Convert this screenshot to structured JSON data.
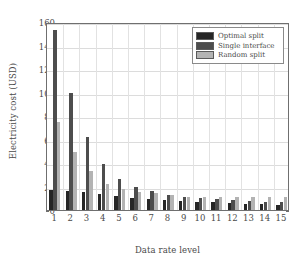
{
  "chart_data": {
    "type": "bar",
    "title": "",
    "xlabel": "Data rate level",
    "ylabel": "Electricity cost (USD)",
    "categories": [
      "1",
      "2",
      "3",
      "4",
      "5",
      "6",
      "7",
      "8",
      "9",
      "10",
      "11",
      "12",
      "13",
      "14",
      "15"
    ],
    "ylim": [
      0,
      160
    ],
    "yticks": [
      0,
      20,
      40,
      60,
      80,
      100,
      120,
      140,
      160
    ],
    "grid": true,
    "legend_position": "top-right",
    "series": [
      {
        "name": "Optimal split",
        "color": "#262626",
        "values": [
          17,
          16.5,
          15,
          13.5,
          12,
          10.5,
          9.5,
          8.5,
          7.5,
          7,
          6.5,
          6,
          5.5,
          5,
          4.5
        ]
      },
      {
        "name": "Single interface",
        "color": "#4d4d4d",
        "values": [
          153,
          99.5,
          62,
          39.5,
          26.5,
          20,
          16,
          13,
          11,
          10,
          9,
          8.5,
          7.5,
          7,
          6.5
        ]
      },
      {
        "name": "Random split",
        "color": "#b3b3b3",
        "values": [
          74.5,
          49.5,
          33,
          22.5,
          17.5,
          15,
          14.5,
          12.5,
          11.5,
          11.5,
          11.5,
          11.5,
          11.5,
          11.5,
          11.5
        ]
      }
    ]
  },
  "legend": {
    "entries": [
      {
        "label": "Optimal split"
      },
      {
        "label": "Single interface"
      },
      {
        "label": "Random split"
      }
    ]
  }
}
